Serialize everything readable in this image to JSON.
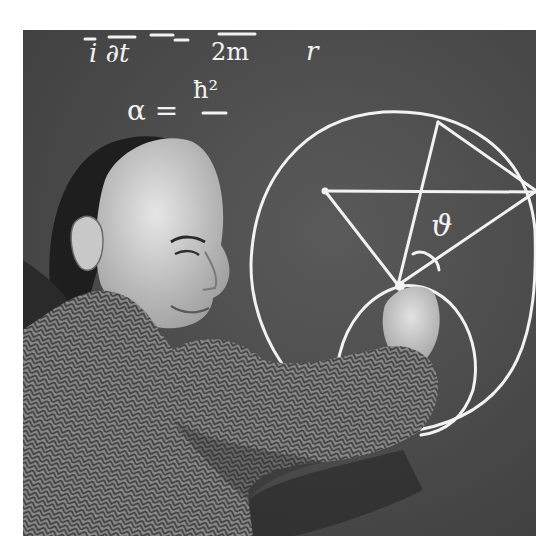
{
  "photo": {
    "description": "Black-and-white photograph of a man in a herringbone tweed jacket drawing a geometric diagram in chalk on a blackboard",
    "style": "monochrome",
    "colors": {
      "frame": "#ffffff",
      "board": "#4e4e4e",
      "chalk": "#f2f2f2",
      "jacket": "#8a8a8a",
      "skin": "#d6d6d6",
      "hair": "#1e1e1e"
    }
  },
  "blackboard": {
    "equation_top": {
      "lhs": "i ∂t",
      "middle": "2m",
      "rhs": "r"
    },
    "equation_alpha": {
      "lhs": "α =",
      "numerator": "ħ²"
    },
    "diagram": {
      "angle_label": "ϑ",
      "shapes": [
        "large circle",
        "small circle",
        "triangle",
        "angle arc"
      ]
    }
  }
}
